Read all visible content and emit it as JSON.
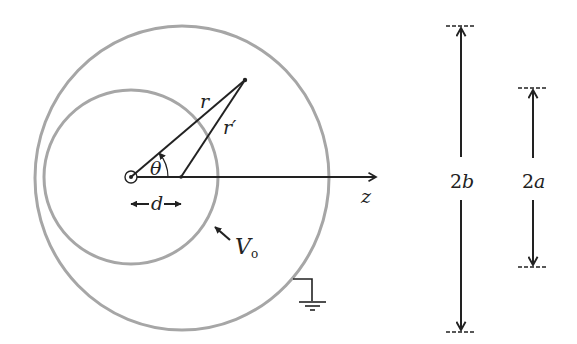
{
  "diagram": {
    "colors": {
      "sphere_stroke": "#a6a6a6",
      "line": "#222222",
      "background": "#ffffff"
    },
    "labels": {
      "r": "r",
      "r_prime": "r′",
      "theta": "θ",
      "d": "d",
      "z": "z",
      "V_main": "V",
      "V_sub": "o",
      "two_b": "2b",
      "two_b_num": "2",
      "two_b_var": "b",
      "two_a_num": "2",
      "two_a_var": "a"
    },
    "geometry": {
      "outer_sphere": {
        "cx": 182,
        "cy": 178,
        "rx": 147,
        "ry": 152,
        "label": "outer grounded sphere, radius b"
      },
      "inner_sphere": {
        "cx": 131,
        "cy": 177,
        "r": 87,
        "label": "inner sphere at potential V0, radius a"
      },
      "origin": {
        "x": 131,
        "y": 177
      },
      "offset_point": {
        "x": 181,
        "y": 177
      },
      "field_point": {
        "x": 245,
        "y": 80
      },
      "z_axis_end": {
        "x": 378,
        "y": 177
      }
    }
  }
}
